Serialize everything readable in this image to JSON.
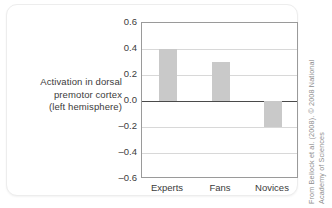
{
  "chart_data": {
    "type": "bar",
    "title": "",
    "subtitle": "",
    "categories": [
      "Experts",
      "Fans",
      "Novices"
    ],
    "values": [
      0.4,
      0.3,
      -0.2
    ],
    "series": [
      {
        "name": "Activation in dorsal premotor cortex (left hemisphere)",
        "values": [
          0.4,
          0.3,
          -0.2
        ]
      }
    ],
    "xlabel": "",
    "ylabel": "Activation in dorsal premotor cortex (left hemisphere)",
    "ylim": [
      -0.6,
      0.6
    ],
    "ytick_labels": [
      "0.6",
      "0.4",
      "0.2",
      "0.0",
      "–0.2",
      "–0.4",
      "–0.6"
    ],
    "ytick_values": [
      0.6,
      0.4,
      0.2,
      0.0,
      -0.2,
      -0.4,
      -0.6
    ],
    "grid": true,
    "zero_line": true,
    "legend": "none",
    "bar_color": "#c9c9c9",
    "gridline_color": "#d8d8d8",
    "zero_line_color": "#4a4a4a",
    "frame_color": "#9a9a9a"
  },
  "axis_caption": {
    "line1": "Activation in dorsal",
    "line2": "premotor cortex",
    "line3": "(left hemisphere)"
  },
  "credit": {
    "line1": "From Beilock et al. (2008). © 2008 National",
    "line2": "Academy of Sciences"
  }
}
